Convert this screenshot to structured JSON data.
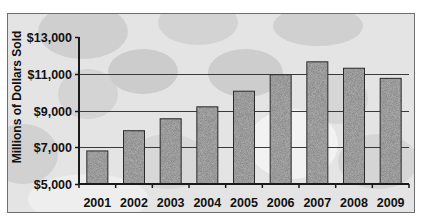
{
  "chart_data": {
    "type": "bar",
    "title": "",
    "xlabel": "",
    "ylabel": "Millions of Dollars Sold",
    "categories": [
      "2001",
      "2002",
      "2003",
      "2004",
      "2005",
      "2006",
      "2007",
      "2008",
      "2009"
    ],
    "values": [
      6800,
      7900,
      8550,
      9200,
      10050,
      10950,
      11650,
      11300,
      10750
    ],
    "ylim": [
      5000,
      13000
    ],
    "yticks": [
      5000,
      7000,
      9000,
      11000,
      13000
    ],
    "ytick_labels": [
      "$5,000",
      "$7,000",
      "$9,000",
      "$11,000",
      "$13,000"
    ],
    "grid": "horizontal major gridlines",
    "legend": "none",
    "bar_fill": "gray speckled texture",
    "background": "photo of plastic water bottles"
  },
  "colors": {
    "bar_fill": "#8a8a8a",
    "bar_border": "#2a2a2a",
    "gridline": "#3a3a3a",
    "axis": "#1a1a1a",
    "frame_border": "#6e6e6e",
    "background": "#e4e4e4"
  }
}
